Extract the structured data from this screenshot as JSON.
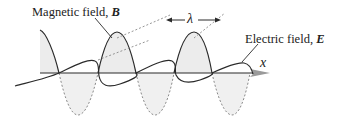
{
  "figure": {
    "type": "electromagnetic-wave",
    "labels": {
      "magnetic_field": "Magnetic field, ",
      "magnetic_symbol": "B",
      "electric_field": "Electric field, ",
      "electric_symbol": "E",
      "wavelength": "λ",
      "axis": "x"
    },
    "colors": {
      "curve": "#2a2a2a",
      "fill": "#ececec",
      "dashed": "#8a8a8a",
      "axis_arrow": "#9a9a9a"
    }
  }
}
